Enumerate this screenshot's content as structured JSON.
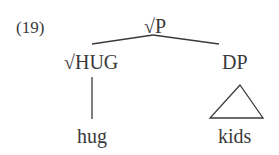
{
  "example_number": "(19)",
  "tree": {
    "root": {
      "label": "√P"
    },
    "left": {
      "label": "√HUG",
      "terminal": "hug"
    },
    "right": {
      "label": "DP",
      "terminal": "kids",
      "triangle": true
    }
  },
  "colors": {
    "ink": "#3a3a3a",
    "background": "#ffffff"
  }
}
